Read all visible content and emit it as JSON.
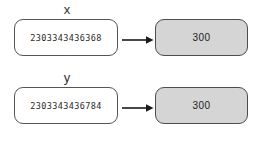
{
  "diagram": {
    "type": "mapping",
    "colors": {
      "source_fill": "#ffffff",
      "source_border": "#555555",
      "target_fill": "#d5d5d5",
      "target_border": "#4d4d4d",
      "arrow": "#1a1a1a",
      "text": "#2b2b2b"
    },
    "rows": [
      {
        "label": "x",
        "source_value": "2303343436368",
        "arrow_icon": "arrow-right-icon",
        "target_value": "300"
      },
      {
        "label": "y",
        "source_value": "2303343436784",
        "arrow_icon": "arrow-right-icon",
        "target_value": "300"
      }
    ]
  }
}
